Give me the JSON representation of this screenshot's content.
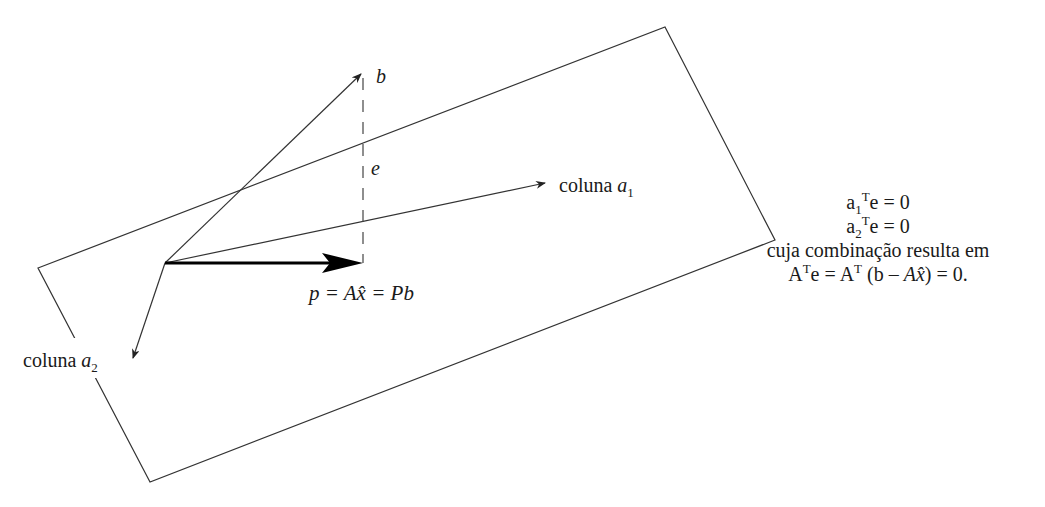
{
  "diagram": {
    "type": "projection-onto-column-space",
    "labels": {
      "b": "b",
      "e": "e",
      "col_a1_text": "coluna ",
      "col_a1_var": "a",
      "col_a1_sub": "1",
      "col_a2_text": "coluna ",
      "col_a2_var": "a",
      "col_a2_sub": "2",
      "projection": "p = Ax̂ = Pb"
    },
    "equations": {
      "eq1_a": "a",
      "eq1_sub": "1",
      "eq1_sup": "T",
      "eq1_rest": "e = 0",
      "eq2_a": "a",
      "eq2_sub": "2",
      "eq2_sup": "T",
      "eq2_rest": "e = 0",
      "line3": "cuja combinação resulta em",
      "line4_A": "A",
      "line4_sup1": "T",
      "line4_mid": "e = A",
      "line4_sup2": "T",
      "line4_paren": " (b – ",
      "line4_ax": "Ax̂",
      "line4_end": ") = 0."
    },
    "colors": {
      "stroke": "#333333",
      "text": "#1a1a1a",
      "background": "#ffffff"
    }
  }
}
